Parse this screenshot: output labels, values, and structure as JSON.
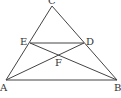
{
  "diagram": {
    "type": "geometry",
    "stroke_color": "#444444",
    "points": {
      "C": {
        "label": "C",
        "x": 52,
        "y": 6
      },
      "A": {
        "label": "A",
        "x": 6,
        "y": 80
      },
      "B": {
        "label": "B",
        "x": 117,
        "y": 80
      },
      "E": {
        "label": "E",
        "x": 30,
        "y": 43
      },
      "D": {
        "label": "D",
        "x": 84,
        "y": 43
      },
      "F": {
        "label": "F",
        "x": 58,
        "y": 55
      }
    },
    "segments": [
      [
        "C",
        "A"
      ],
      [
        "C",
        "B"
      ],
      [
        "A",
        "B"
      ],
      [
        "E",
        "D"
      ],
      [
        "E",
        "B"
      ],
      [
        "A",
        "D"
      ]
    ]
  }
}
